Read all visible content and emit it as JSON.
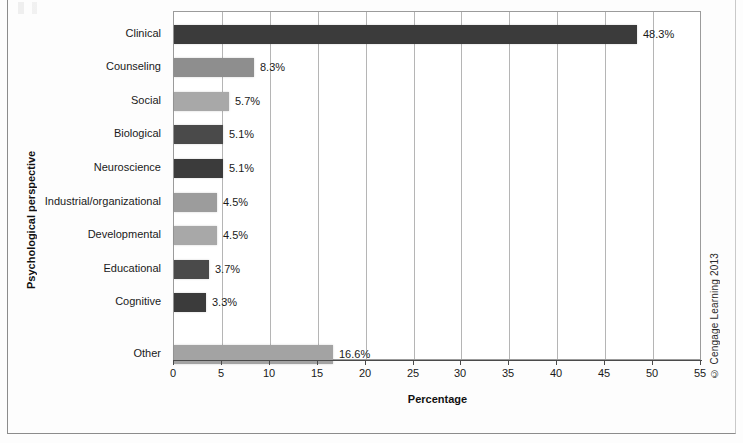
{
  "figure": {
    "credit": "© Cengage Learning 2013"
  },
  "chart_data": {
    "type": "bar",
    "orientation": "horizontal",
    "title": "",
    "xlabel": "Percentage",
    "ylabel": "Psychological perspective",
    "xlim": [
      0,
      55
    ],
    "xticks": [
      0,
      5,
      10,
      15,
      20,
      25,
      30,
      35,
      40,
      45,
      50,
      55
    ],
    "xtick_labels": [
      "0",
      "5",
      "10",
      "15",
      "20",
      "25",
      "30",
      "35",
      "40",
      "45",
      "50",
      "55"
    ],
    "grid": "vertical",
    "legend": "none",
    "categories": [
      "Clinical",
      "Counseling",
      "Social",
      "Biological",
      "Neuroscience",
      "Industrial/organizational",
      "Developmental",
      "Educational",
      "Cognitive",
      "Other"
    ],
    "values": [
      48.3,
      8.3,
      5.7,
      5.1,
      5.1,
      4.5,
      4.5,
      3.7,
      3.3,
      16.6
    ],
    "data_labels": [
      "48.3%",
      "8.3%",
      "5.7%",
      "5.1%",
      "5.1%",
      "4.5%",
      "4.5%",
      "3.7%",
      "3.3%",
      "16.6%"
    ],
    "bar_colors": [
      "#3b3b3b",
      "#8e8e8e",
      "#a8a8a8",
      "#4a4a4a",
      "#3b3b3b",
      "#9c9c9c",
      "#a8a8a8",
      "#4a4a4a",
      "#3b3b3b",
      "#a3a3a3"
    ]
  }
}
